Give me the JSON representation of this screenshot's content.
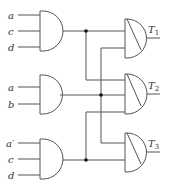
{
  "diagram": {
    "type": "logic-circuit",
    "colors": {
      "wire": "#555555",
      "junction": "#111111",
      "background": "#ffffff"
    },
    "input_gates": [
      {
        "id": "g1",
        "kind": "AND",
        "inputs": [
          "a",
          "c",
          "d"
        ]
      },
      {
        "id": "g2",
        "kind": "AND",
        "inputs": [
          "a",
          "b"
        ]
      },
      {
        "id": "g3",
        "kind": "AND",
        "inputs": [
          "a′",
          "c",
          "d"
        ]
      }
    ],
    "output_gates": [
      {
        "id": "t1",
        "kind": "AND",
        "label_main": "T",
        "label_sub": "1",
        "from": [
          "g1",
          "g2"
        ]
      },
      {
        "id": "t2",
        "kind": "AND",
        "label_main": "T",
        "label_sub": "2",
        "from": [
          "g1",
          "g2",
          "g3"
        ]
      },
      {
        "id": "t3",
        "kind": "AND",
        "label_main": "T",
        "label_sub": "3",
        "from": [
          "g2",
          "g3"
        ]
      }
    ]
  }
}
